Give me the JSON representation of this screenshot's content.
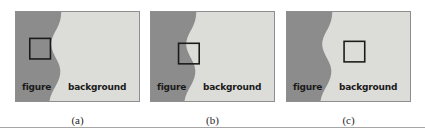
{
  "figure": {
    "panel_count": 3,
    "region_labels": {
      "figure": "figure",
      "background": "background"
    },
    "colors": {
      "figure_region": "#8c8c8c",
      "background_region": "#dcdcd8",
      "panel_border": "#8e8e8e",
      "probe_outline": "#1a1a1a",
      "label_text": "#1a1a1a",
      "caption_text": "#1f1f1f",
      "rule": "#a6a6a6",
      "page_background": "#ffffff"
    },
    "panels": [
      {
        "id": "panel-a",
        "caption": "(a)",
        "label_figure": "figure",
        "label_background": "background",
        "probe": {
          "name": "square-probe",
          "x": 14,
          "y": 27,
          "size": 21,
          "placement": "inside-figure"
        }
      },
      {
        "id": "panel-b",
        "caption": "(b)",
        "label_figure": "figure",
        "label_background": "background",
        "probe": {
          "name": "square-probe",
          "x": 28,
          "y": 32,
          "size": 21,
          "placement": "on-boundary"
        }
      },
      {
        "id": "panel-c",
        "caption": "(c)",
        "label_figure": "figure",
        "label_background": "background",
        "probe": {
          "name": "square-probe",
          "x": 58,
          "y": 30,
          "size": 21,
          "placement": "inside-background"
        }
      }
    ],
    "boundary_curve": "M 0,0 L 46,0 C 46,14 38,20 36,30 C 34,41 44,49 45,59 C 46,71 36,79 34,91 L 0,91 Z"
  }
}
